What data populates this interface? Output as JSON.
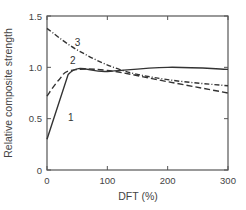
{
  "chart_data": {
    "type": "line",
    "title": "",
    "xlabel": "DFT (%)",
    "ylabel": "Relative composite strength",
    "xlim": [
      0,
      300
    ],
    "ylim": [
      0,
      1.5
    ],
    "xticks": [
      0,
      100,
      200,
      300
    ],
    "yticks": [
      0,
      0.5,
      1.0,
      1.5
    ],
    "xtick_labels": [
      "0",
      "100",
      "200",
      "300"
    ],
    "ytick_labels": [
      "0",
      "0.5",
      "1.0",
      "1.5"
    ],
    "grid": false,
    "legend": "inline curve labels",
    "series": [
      {
        "name": "1",
        "style": "solid",
        "x": [
          0,
          35,
          100,
          200,
          300
        ],
        "y": [
          0.3,
          0.93,
          0.96,
          1.0,
          0.98
        ]
      },
      {
        "name": "2",
        "style": "dashed",
        "x": [
          0,
          20,
          40,
          100,
          200,
          300
        ],
        "y": [
          0.72,
          0.88,
          0.97,
          0.97,
          0.86,
          0.75
        ]
      },
      {
        "name": "3",
        "style": "dash-dot",
        "x": [
          0,
          50,
          120,
          200,
          300
        ],
        "y": [
          1.38,
          1.17,
          0.98,
          0.88,
          0.82
        ]
      }
    ]
  }
}
